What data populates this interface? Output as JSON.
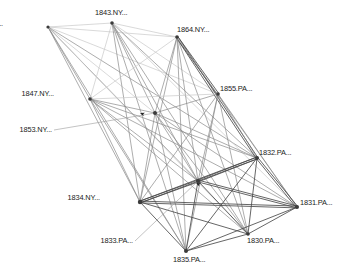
{
  "figure": {
    "type": "network-graph",
    "background_color": "#ffffff",
    "width": 342,
    "height": 278,
    "edge_color_dark": "#4a4a4a",
    "edge_color_mid": "#8a8a8a",
    "edge_color_light": "#c8c8c8",
    "node_color": "#3b3b3b",
    "label_color": "#1a1a1a",
    "leader_color": "#9a9a9a"
  },
  "chart_data": {
    "type": "network",
    "title": "",
    "directed": true,
    "nodes": [
      {
        "id": "1848.OH",
        "label": "1848.OH...",
        "x": 48,
        "y": 27,
        "r": 1.6,
        "label_x": 3,
        "label_y": 20,
        "anchor": "end",
        "leader": false
      },
      {
        "id": "1843.NY",
        "label": "1843.NY...",
        "x": 112,
        "y": 23,
        "r": 1.8,
        "label_x": 95,
        "label_y": 9,
        "anchor": "start",
        "leader": false
      },
      {
        "id": "1864.NY",
        "label": "1864.NY...",
        "x": 177,
        "y": 37,
        "r": 1.8,
        "label_x": 177,
        "label_y": 26,
        "anchor": "start",
        "leader": false
      },
      {
        "id": "1847.NY",
        "label": "1847.NY...",
        "x": 90,
        "y": 99,
        "r": 1.8,
        "label_x": 54,
        "label_y": 90,
        "anchor": "end",
        "leader": false
      },
      {
        "id": "1855.PA",
        "label": "1855.PA...",
        "x": 218,
        "y": 94,
        "r": 1.8,
        "label_x": 220,
        "label_y": 85,
        "anchor": "start",
        "leader": false
      },
      {
        "id": "1853.NY",
        "label": "1853.NY...",
        "x": 155,
        "y": 113,
        "r": 2.0,
        "label_x": 52,
        "label_y": 126,
        "anchor": "end",
        "leader": true
      },
      {
        "id": "1832.PA",
        "label": "1832.PA...",
        "x": 257,
        "y": 158,
        "r": 2.0,
        "label_x": 259,
        "label_y": 149,
        "anchor": "start",
        "leader": false
      },
      {
        "id": "1833.PA",
        "label": "1833.PA...",
        "x": 198,
        "y": 181,
        "r": 2.0,
        "label_x": 133,
        "label_y": 237,
        "anchor": "end",
        "leader": true
      },
      {
        "id": "1834.NY",
        "label": "1834.NY...",
        "x": 140,
        "y": 202,
        "r": 2.2,
        "label_x": 100,
        "label_y": 194,
        "anchor": "end",
        "leader": false
      },
      {
        "id": "1831.PA",
        "label": "1831.PA...",
        "x": 297,
        "y": 207,
        "r": 2.0,
        "label_x": 300,
        "label_y": 199,
        "anchor": "start",
        "leader": false
      },
      {
        "id": "1830.PA",
        "label": "1830.PA...",
        "x": 248,
        "y": 234,
        "r": 1.8,
        "label_x": 247,
        "label_y": 237,
        "anchor": "start",
        "leader": false
      },
      {
        "id": "1835.PA",
        "label": "1835.PA...",
        "x": 186,
        "y": 251,
        "r": 2.0,
        "label_x": 173,
        "label_y": 256,
        "anchor": "start",
        "leader": false
      }
    ],
    "edges": [
      {
        "source": "1848.OH",
        "target": "1843.NY",
        "weight": 1,
        "tone": "light"
      },
      {
        "source": "1848.OH",
        "target": "1864.NY",
        "weight": 1,
        "tone": "light"
      },
      {
        "source": "1848.OH",
        "target": "1847.NY",
        "weight": 1,
        "tone": "mid"
      },
      {
        "source": "1848.OH",
        "target": "1855.PA",
        "weight": 1,
        "tone": "light"
      },
      {
        "source": "1848.OH",
        "target": "1853.NY",
        "weight": 1,
        "tone": "light"
      },
      {
        "source": "1848.OH",
        "target": "1832.PA",
        "weight": 1,
        "tone": "mid"
      },
      {
        "source": "1848.OH",
        "target": "1833.PA",
        "weight": 1,
        "tone": "mid"
      },
      {
        "source": "1848.OH",
        "target": "1834.NY",
        "weight": 1,
        "tone": "mid"
      },
      {
        "source": "1848.OH",
        "target": "1835.PA",
        "weight": 1,
        "tone": "mid"
      },
      {
        "source": "1848.OH",
        "target": "1830.PA",
        "weight": 1,
        "tone": "light"
      },
      {
        "source": "1843.NY",
        "target": "1864.NY",
        "weight": 1,
        "tone": "light"
      },
      {
        "source": "1843.NY",
        "target": "1847.NY",
        "weight": 1,
        "tone": "light"
      },
      {
        "source": "1843.NY",
        "target": "1855.PA",
        "weight": 1,
        "tone": "light"
      },
      {
        "source": "1843.NY",
        "target": "1853.NY",
        "weight": 1,
        "tone": "mid"
      },
      {
        "source": "1843.NY",
        "target": "1832.PA",
        "weight": 1,
        "tone": "mid"
      },
      {
        "source": "1843.NY",
        "target": "1833.PA",
        "weight": 1,
        "tone": "mid"
      },
      {
        "source": "1843.NY",
        "target": "1834.NY",
        "weight": 1,
        "tone": "mid"
      },
      {
        "source": "1843.NY",
        "target": "1835.PA",
        "weight": 1,
        "tone": "mid"
      },
      {
        "source": "1843.NY",
        "target": "1830.PA",
        "weight": 1,
        "tone": "mid"
      },
      {
        "source": "1843.NY",
        "target": "1831.PA",
        "weight": 1,
        "tone": "light"
      },
      {
        "source": "1864.NY",
        "target": "1847.NY",
        "weight": 1,
        "tone": "light"
      },
      {
        "source": "1864.NY",
        "target": "1855.PA",
        "weight": 2,
        "tone": "dark"
      },
      {
        "source": "1864.NY",
        "target": "1853.NY",
        "weight": 1,
        "tone": "mid"
      },
      {
        "source": "1864.NY",
        "target": "1832.PA",
        "weight": 2,
        "tone": "dark"
      },
      {
        "source": "1864.NY",
        "target": "1833.PA",
        "weight": 1,
        "tone": "mid"
      },
      {
        "source": "1864.NY",
        "target": "1834.NY",
        "weight": 1,
        "tone": "mid"
      },
      {
        "source": "1864.NY",
        "target": "1835.PA",
        "weight": 1,
        "tone": "mid"
      },
      {
        "source": "1864.NY",
        "target": "1830.PA",
        "weight": 1,
        "tone": "mid"
      },
      {
        "source": "1864.NY",
        "target": "1831.PA",
        "weight": 1,
        "tone": "mid"
      },
      {
        "source": "1847.NY",
        "target": "1855.PA",
        "weight": 1,
        "tone": "light"
      },
      {
        "source": "1847.NY",
        "target": "1853.NY",
        "weight": 1,
        "tone": "mid"
      },
      {
        "source": "1847.NY",
        "target": "1832.PA",
        "weight": 1,
        "tone": "mid"
      },
      {
        "source": "1847.NY",
        "target": "1833.PA",
        "weight": 1,
        "tone": "mid"
      },
      {
        "source": "1847.NY",
        "target": "1834.NY",
        "weight": 1,
        "tone": "mid"
      },
      {
        "source": "1847.NY",
        "target": "1835.PA",
        "weight": 1,
        "tone": "mid"
      },
      {
        "source": "1847.NY",
        "target": "1830.PA",
        "weight": 1,
        "tone": "mid"
      },
      {
        "source": "1847.NY",
        "target": "1831.PA",
        "weight": 1,
        "tone": "mid"
      },
      {
        "source": "1855.PA",
        "target": "1853.NY",
        "weight": 1,
        "tone": "mid"
      },
      {
        "source": "1855.PA",
        "target": "1832.PA",
        "weight": 1,
        "tone": "mid"
      },
      {
        "source": "1855.PA",
        "target": "1833.PA",
        "weight": 1,
        "tone": "mid"
      },
      {
        "source": "1855.PA",
        "target": "1834.NY",
        "weight": 1,
        "tone": "mid"
      },
      {
        "source": "1855.PA",
        "target": "1835.PA",
        "weight": 1,
        "tone": "mid"
      },
      {
        "source": "1855.PA",
        "target": "1830.PA",
        "weight": 1,
        "tone": "mid"
      },
      {
        "source": "1855.PA",
        "target": "1831.PA",
        "weight": 1,
        "tone": "mid"
      },
      {
        "source": "1853.NY",
        "target": "1832.PA",
        "weight": 1,
        "tone": "mid"
      },
      {
        "source": "1853.NY",
        "target": "1833.PA",
        "weight": 1,
        "tone": "mid"
      },
      {
        "source": "1853.NY",
        "target": "1834.NY",
        "weight": 1,
        "tone": "mid"
      },
      {
        "source": "1853.NY",
        "target": "1835.PA",
        "weight": 1,
        "tone": "mid"
      },
      {
        "source": "1853.NY",
        "target": "1830.PA",
        "weight": 1,
        "tone": "mid"
      },
      {
        "source": "1853.NY",
        "target": "1831.PA",
        "weight": 1,
        "tone": "mid"
      },
      {
        "source": "1832.PA",
        "target": "1833.PA",
        "weight": 2,
        "tone": "dark"
      },
      {
        "source": "1832.PA",
        "target": "1834.NY",
        "weight": 2,
        "tone": "dark"
      },
      {
        "source": "1832.PA",
        "target": "1835.PA",
        "weight": 1,
        "tone": "dark"
      },
      {
        "source": "1832.PA",
        "target": "1830.PA",
        "weight": 1,
        "tone": "dark"
      },
      {
        "source": "1832.PA",
        "target": "1831.PA",
        "weight": 2,
        "tone": "dark"
      },
      {
        "source": "1833.PA",
        "target": "1834.NY",
        "weight": 2,
        "tone": "dark"
      },
      {
        "source": "1833.PA",
        "target": "1835.PA",
        "weight": 1,
        "tone": "dark"
      },
      {
        "source": "1833.PA",
        "target": "1830.PA",
        "weight": 1,
        "tone": "dark"
      },
      {
        "source": "1833.PA",
        "target": "1831.PA",
        "weight": 2,
        "tone": "dark"
      },
      {
        "source": "1834.NY",
        "target": "1835.PA",
        "weight": 1,
        "tone": "dark"
      },
      {
        "source": "1834.NY",
        "target": "1830.PA",
        "weight": 1,
        "tone": "dark"
      },
      {
        "source": "1834.NY",
        "target": "1831.PA",
        "weight": 2,
        "tone": "dark"
      },
      {
        "source": "1835.PA",
        "target": "1830.PA",
        "weight": 1,
        "tone": "dark"
      },
      {
        "source": "1835.PA",
        "target": "1831.PA",
        "weight": 1,
        "tone": "dark"
      },
      {
        "source": "1830.PA",
        "target": "1831.PA",
        "weight": 1,
        "tone": "dark"
      }
    ],
    "arrow_markers": [
      {
        "x": 140,
        "y": 113,
        "angle": 200
      },
      {
        "x": 196,
        "y": 183,
        "angle": 205
      }
    ],
    "legend": [],
    "annotations": []
  }
}
